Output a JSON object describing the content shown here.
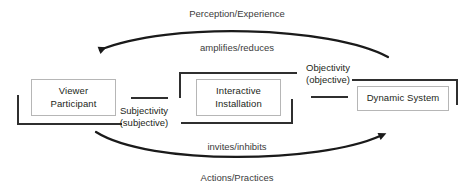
{
  "diagram": {
    "colors": {
      "background": "#ffffff",
      "box_border": "#b6b6b6",
      "box_text": "#231f20",
      "arc_stroke": "#1a1a1a",
      "bracket_stroke": "#2f2f2f",
      "label_text": "#3b3b3b"
    },
    "nodes": [
      {
        "id": "viewer-participant",
        "line1": "Viewer",
        "line2": "Participant"
      },
      {
        "id": "interactive-installation",
        "line1": "Interactive",
        "line2": "Installation"
      },
      {
        "id": "dynamic-system",
        "line1": "Dynamic System",
        "line2": ""
      }
    ],
    "relations": [
      {
        "id": "subjectivity",
        "line1": "Subjectivity",
        "line2": "(subjective)"
      },
      {
        "id": "objectivity",
        "line1": "Objectivity",
        "line2": "(objective)"
      }
    ],
    "arcs": {
      "top": {
        "outer_label": "Perception/Experience",
        "inner_label": "amplifies/reduces",
        "direction": "right-to-left"
      },
      "bottom": {
        "inner_label": "invites/inhibits",
        "outer_label": "Actions/Practices",
        "direction": "left-to-right"
      }
    }
  }
}
